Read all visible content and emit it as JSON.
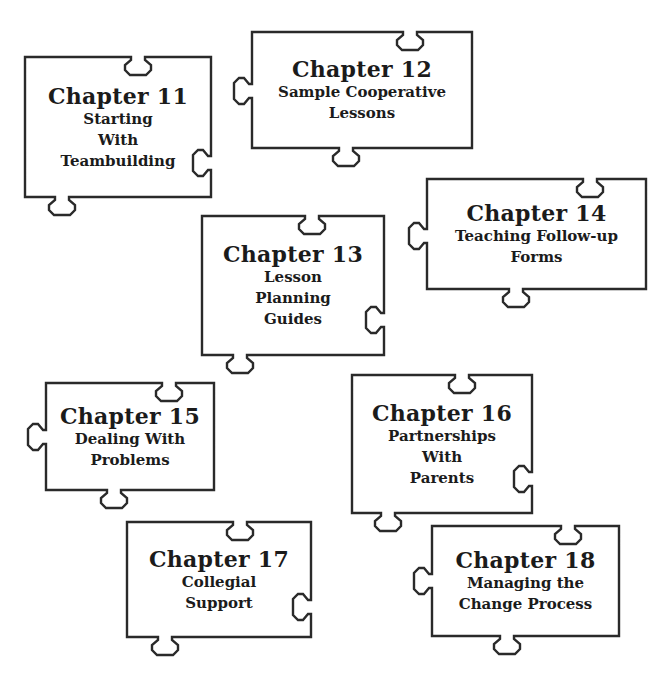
{
  "pieces": [
    {
      "id": "11",
      "chapter": "Chapter 11",
      "lines": [
        "Starting",
        "With",
        "Teambuilding"
      ],
      "box": [
        25,
        57,
        211,
        197
      ],
      "tabs": [
        {
          "side": "top",
          "pos": 138,
          "dir": "in"
        },
        {
          "side": "right",
          "pos": 163,
          "dir": "in"
        },
        {
          "side": "bottom",
          "pos": 62,
          "dir": "out"
        }
      ]
    },
    {
      "id": "12",
      "chapter": "Chapter 12",
      "lines": [
        "Sample Cooperative",
        "Lessons"
      ],
      "box": [
        252,
        32,
        472,
        148
      ],
      "tabs": [
        {
          "side": "top",
          "pos": 410,
          "dir": "in"
        },
        {
          "side": "left",
          "pos": 91,
          "dir": "out"
        },
        {
          "side": "bottom",
          "pos": 346,
          "dir": "out"
        }
      ]
    },
    {
      "id": "13",
      "chapter": "Chapter 13",
      "lines": [
        "Lesson",
        "Planning",
        "Guides"
      ],
      "box": [
        202,
        216,
        384,
        355
      ],
      "tabs": [
        {
          "side": "top",
          "pos": 312,
          "dir": "in"
        },
        {
          "side": "right",
          "pos": 320,
          "dir": "in"
        },
        {
          "side": "bottom",
          "pos": 240,
          "dir": "out"
        }
      ]
    },
    {
      "id": "14",
      "chapter": "Chapter 14",
      "lines": [
        "Teaching Follow-up",
        "Forms"
      ],
      "box": [
        427,
        179,
        646,
        289
      ],
      "tabs": [
        {
          "side": "top",
          "pos": 590,
          "dir": "in"
        },
        {
          "side": "left",
          "pos": 236,
          "dir": "out"
        },
        {
          "side": "bottom",
          "pos": 516,
          "dir": "out"
        }
      ]
    },
    {
      "id": "15",
      "chapter": "Chapter 15",
      "lines": [
        "Dealing With",
        "Problems"
      ],
      "box": [
        46,
        383,
        214,
        490
      ],
      "tabs": [
        {
          "side": "top",
          "pos": 169,
          "dir": "in"
        },
        {
          "side": "left",
          "pos": 437,
          "dir": "out"
        },
        {
          "side": "bottom",
          "pos": 114,
          "dir": "out"
        }
      ]
    },
    {
      "id": "16",
      "chapter": "Chapter 16",
      "lines": [
        "Partnerships",
        "With",
        "Parents"
      ],
      "box": [
        352,
        375,
        532,
        513
      ],
      "tabs": [
        {
          "side": "top",
          "pos": 462,
          "dir": "in"
        },
        {
          "side": "right",
          "pos": 479,
          "dir": "in"
        },
        {
          "side": "bottom",
          "pos": 388,
          "dir": "out"
        }
      ]
    },
    {
      "id": "17",
      "chapter": "Chapter 17",
      "lines": [
        "Collegial",
        "Support"
      ],
      "box": [
        127,
        522,
        311,
        637
      ],
      "tabs": [
        {
          "side": "top",
          "pos": 240,
          "dir": "in"
        },
        {
          "side": "right",
          "pos": 607,
          "dir": "in"
        },
        {
          "side": "bottom",
          "pos": 165,
          "dir": "out"
        }
      ]
    },
    {
      "id": "18",
      "chapter": "Chapter 18",
      "lines": [
        "Managing the",
        "Change Process"
      ],
      "box": [
        432,
        526,
        619,
        636
      ],
      "tabs": [
        {
          "side": "top",
          "pos": 568,
          "dir": "in"
        },
        {
          "side": "left",
          "pos": 581,
          "dir": "out"
        },
        {
          "side": "bottom",
          "pos": 507,
          "dir": "out"
        }
      ]
    }
  ],
  "colors": {
    "stroke": "#2a2a2a",
    "text": "#1b1b1b",
    "background": "#ffffff"
  }
}
